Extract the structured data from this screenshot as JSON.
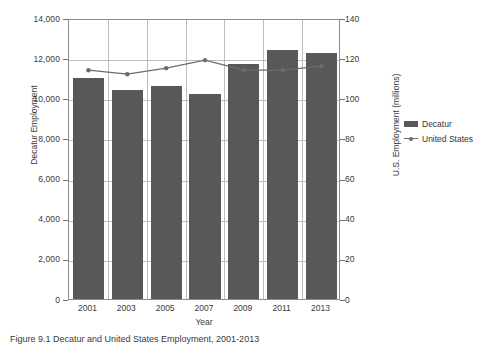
{
  "caption": "Figure 9.1 Decatur and United States Employment, 2001-2013",
  "legend": {
    "position": "right",
    "items": [
      {
        "label": "Decatur",
        "marker": "bar-swatch",
        "color": "#585858"
      },
      {
        "label": "United States",
        "marker": "line-marker",
        "color": "#6b6b6b"
      }
    ]
  },
  "chart_data": {
    "type": "bar",
    "title": "",
    "xlabel": "Year",
    "ylabel": "Decatur Employment",
    "y2label": "U.S. Employment (millions)",
    "categories": [
      "2001",
      "2003",
      "2005",
      "2007",
      "2009",
      "2011",
      "2013"
    ],
    "x_tick_labels": [
      "2001",
      "2003",
      "2005",
      "2007",
      "2009",
      "2011",
      "2013"
    ],
    "y_tick_labels": [
      "0",
      "2,000",
      "4,000",
      "6,000",
      "8,000",
      "10,000",
      "12,000",
      "14,000"
    ],
    "y_ticks": [
      0,
      2000,
      4000,
      6000,
      8000,
      10000,
      12000,
      14000
    ],
    "ylim": [
      0,
      14000
    ],
    "y2_tick_labels": [
      "0",
      "20",
      "40",
      "60",
      "80",
      "100",
      "120",
      "140"
    ],
    "y2_ticks": [
      0,
      20,
      40,
      60,
      80,
      100,
      120,
      140
    ],
    "y2lim": [
      0,
      140
    ],
    "grid": true,
    "series": [
      {
        "name": "Decatur",
        "type": "bar",
        "axis": "left",
        "color": "#585858",
        "values": [
          11000,
          10400,
          10600,
          10200,
          11700,
          12400,
          12250
        ]
      },
      {
        "name": "United States",
        "type": "line",
        "axis": "right",
        "color": "#6b6b6b",
        "values": [
          115,
          113,
          116,
          120,
          115,
          115,
          117
        ]
      }
    ]
  }
}
